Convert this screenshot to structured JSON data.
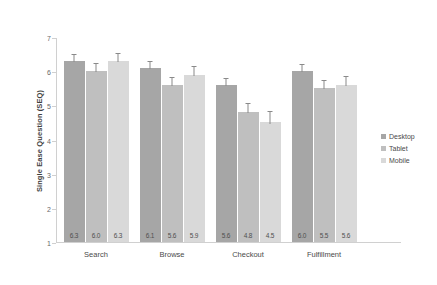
{
  "chart_data": {
    "type": "bar",
    "title": "",
    "subtitle": "",
    "xlabel": "",
    "ylabel": "Single Ease Question (SEQ)",
    "ylim": [
      1,
      7
    ],
    "yticks": [
      "7",
      "6",
      "5",
      "4",
      "3",
      "2",
      "1"
    ],
    "ytick_values": [
      7,
      6,
      5,
      4,
      3,
      2,
      1
    ],
    "grid": false,
    "legend_position": "right",
    "error_bars": true,
    "categories": [
      "Search",
      "Browse",
      "Checkout",
      "Fulfillment"
    ],
    "series": [
      {
        "name": "Desktop",
        "color": "#a6a6a6",
        "values": [
          6.3,
          6.1,
          5.6,
          6.0
        ],
        "labels": [
          "6.3",
          "6.1",
          "5.6",
          "6.0"
        ],
        "errors": [
          0.18,
          0.18,
          0.18,
          0.18
        ]
      },
      {
        "name": "Tablet",
        "color": "#bfbfbf",
        "values": [
          6.0,
          5.6,
          4.8,
          5.5
        ],
        "labels": [
          "6.0",
          "5.6",
          "4.8",
          "5.5"
        ],
        "errors": [
          0.2,
          0.2,
          0.24,
          0.2
        ]
      },
      {
        "name": "Mobile",
        "color": "#d9d9d9",
        "values": [
          6.3,
          5.9,
          4.5,
          5.6
        ],
        "labels": [
          "6.3",
          "5.9",
          "4.5",
          "5.6"
        ],
        "errors": [
          0.2,
          0.22,
          0.3,
          0.22
        ]
      }
    ]
  },
  "legend": {
    "items": [
      {
        "label": "Desktop",
        "color": "#a6a6a6"
      },
      {
        "label": "Tablet",
        "color": "#bfbfbf"
      },
      {
        "label": "Mobile",
        "color": "#d9d9d9"
      }
    ]
  }
}
